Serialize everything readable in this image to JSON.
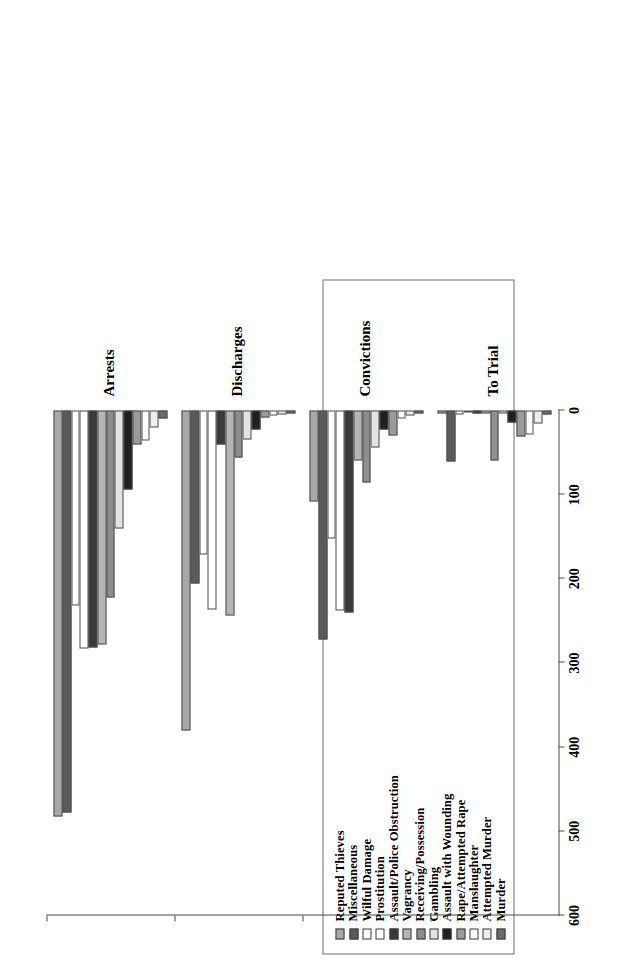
{
  "figure": {
    "rotation_note": "chart printed rotated 90 degrees counter-clockwise on the page",
    "background_color": "#ffffff",
    "axis_color": "#4a4a4a"
  },
  "legend": {
    "border_color": "#6e6e6e",
    "items": [
      {
        "label": "Reputed Thieves",
        "color": "#a8a8a8"
      },
      {
        "label": "Miscellaneous",
        "color": "#5a5a5a"
      },
      {
        "label": "Wilful Damage",
        "color": "#ffffff"
      },
      {
        "label": "Prostitution",
        "color": "#ffffff"
      },
      {
        "label": "Assault/Police Obstruction",
        "color": "#3a3a3a"
      },
      {
        "label": "Vagrancy",
        "color": "#b5b5b5"
      },
      {
        "label": "Receiving/Possession",
        "color": "#8e8e8e"
      },
      {
        "label": "Gambling",
        "color": "#e3e3e3"
      },
      {
        "label": "Assault with Wounding",
        "color": "#1f1f1f"
      },
      {
        "label": "Rape/Attempted Rape",
        "color": "#9b9b9b"
      },
      {
        "label": "Manslaughter",
        "color": "#ffffff"
      },
      {
        "label": "Attempted Murder",
        "color": "#ededed"
      },
      {
        "label": "Murder",
        "color": "#6b6b6b"
      }
    ]
  },
  "chart_data": {
    "type": "bar",
    "orientation": "vertical-drawn-rotated",
    "title": "",
    "xlabel": "",
    "ylabel": "",
    "ylim": [
      0,
      600
    ],
    "yticks": [
      0,
      100,
      200,
      300,
      400,
      500,
      600
    ],
    "ytick_labels": [
      "0",
      "100",
      "200",
      "300",
      "400",
      "500",
      "600"
    ],
    "grid": false,
    "legend_position": "top-left (rotated page: upper block)",
    "categories": [
      "Arrests",
      "Discharges",
      "Convictions",
      "To Trial"
    ],
    "series": [
      {
        "name": "Reputed Thieves",
        "color": "#a8a8a8",
        "values": [
          482,
          380,
          108,
          3
        ]
      },
      {
        "name": "Miscellaneous",
        "color": "#5a5a5a",
        "values": [
          478,
          205,
          272,
          61
        ]
      },
      {
        "name": "Wilful Damage",
        "color": "#ffffff",
        "values": [
          232,
          171,
          152,
          5
        ]
      },
      {
        "name": "Prostitution",
        "color": "#ffffff",
        "values": [
          283,
          236,
          238,
          2
        ]
      },
      {
        "name": "Assault/Police Obstruction",
        "color": "#3a3a3a",
        "values": [
          281,
          40,
          240,
          4
        ]
      },
      {
        "name": "Vagrancy",
        "color": "#b5b5b5",
        "values": [
          278,
          243,
          60,
          3
        ]
      },
      {
        "name": "Receiving/Possession",
        "color": "#8e8e8e",
        "values": [
          222,
          56,
          85,
          60
        ]
      },
      {
        "name": "Gambling",
        "color": "#e3e3e3",
        "values": [
          140,
          34,
          44,
          3
        ]
      },
      {
        "name": "Assault with Wounding",
        "color": "#1f1f1f",
        "values": [
          94,
          22,
          22,
          14
        ]
      },
      {
        "name": "Rape/Attempted Rape",
        "color": "#9b9b9b",
        "values": [
          40,
          8,
          30,
          31
        ]
      },
      {
        "name": "Manslaughter",
        "color": "#ffffff",
        "values": [
          36,
          6,
          10,
          28
        ]
      },
      {
        "name": "Attempted Murder",
        "color": "#ededed",
        "values": [
          20,
          5,
          6,
          16
        ]
      },
      {
        "name": "Murder",
        "color": "#6b6b6b",
        "values": [
          10,
          4,
          4,
          5
        ]
      }
    ]
  }
}
